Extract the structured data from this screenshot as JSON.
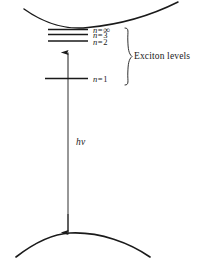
{
  "figure": {
    "background_color": "#ffffff",
    "line_color": "#1a1a1a",
    "width": 202,
    "height": 258
  },
  "bands": {
    "conduction_band": {
      "name": "conduction-band-curve",
      "shape": "upward-opening parabola",
      "vertex": "87,27"
    },
    "valence_band": {
      "name": "valence-band-curve",
      "shape": "downward-opening parabola",
      "vertex": "70,233"
    }
  },
  "levels": [
    {
      "id": "n-infinity",
      "label_var": "n",
      "label_eq": "=",
      "label_num": "∞",
      "y": 29.5
    },
    {
      "id": "n-3",
      "label_var": "n",
      "label_eq": "=",
      "label_num": "3",
      "y": 34.5
    },
    {
      "id": "n-2",
      "label_var": "n",
      "label_eq": "=",
      "label_num": "2",
      "y": 41.0
    },
    {
      "id": "n-1",
      "label_var": "n",
      "label_eq": "=",
      "label_num": "1",
      "y": 78.5
    }
  ],
  "brace": {
    "label": "Exciton  levels"
  },
  "transition": {
    "photon_label": "hν",
    "binding_arrow_name": "binding-energy-arrow",
    "photon_arrow_name": "photon-absorption-arrow"
  }
}
